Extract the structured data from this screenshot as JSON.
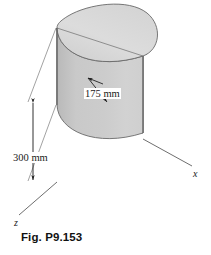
{
  "figure": {
    "caption": "Fig. P9.153",
    "background_color": "#ffffff"
  },
  "dimensions": [
    {
      "id": "height",
      "label": "300 mm",
      "value": 300,
      "unit": "mm",
      "measures": "vertical height of the shell",
      "orientation": "vertical",
      "arrowheads": "both-ends"
    },
    {
      "id": "radius",
      "label": "175 mm",
      "value": 175,
      "unit": "mm",
      "measures": "radius of the semicircular cross-section",
      "orientation": "diagonal",
      "arrowheads": "both-ends"
    }
  ],
  "axes": [
    {
      "id": "y-axis",
      "label": "y",
      "direction": "vertical-up"
    },
    {
      "id": "x-axis",
      "label": "x",
      "direction": "lower-right"
    },
    {
      "id": "z-axis",
      "label": "z",
      "direction": "lower-left"
    }
  ],
  "colors": {
    "outline": "#5a5a5a",
    "axis_line": "#6e6e6e",
    "top_cap_fill": "#d9d9d9",
    "curved_face_light": "#c7c7c7",
    "curved_face_mid": "#cfcfcf",
    "flat_face_fill": "#bfbfbf",
    "text": "#1a1a1a"
  }
}
